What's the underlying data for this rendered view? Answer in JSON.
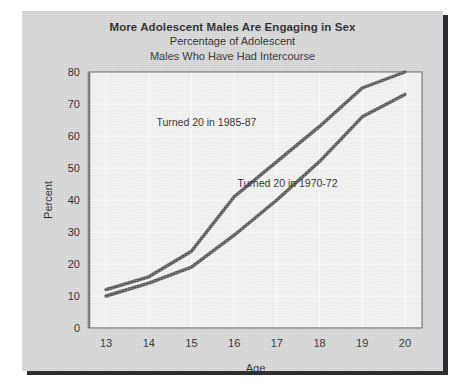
{
  "figure": {
    "title_main": "More Adolescent Males Are Engaging in Sex",
    "title_sub_line1": "Percentage of Adolescent",
    "title_sub_line2": "Males Who Have Had Intercourse",
    "card_color": "#d5d5d5",
    "plot_background": "#f2f2f2",
    "shadow_color": "#2e2e30",
    "line_color": "#585858",
    "gridline_color": "#ffffff",
    "axis_color": "#6b6b6b"
  },
  "chart_data": {
    "type": "line",
    "title": "More Adolescent Males Are Engaging in Sex",
    "subtitle": "Percentage of Adolescent Males Who Have Had Intercourse",
    "xlabel": "Age",
    "ylabel": "Percent",
    "x": [
      13,
      14,
      15,
      16,
      17,
      18,
      19,
      20
    ],
    "xticklabels": [
      "13",
      "14",
      "15",
      "16",
      "17",
      "18",
      "19",
      "20"
    ],
    "yticks": [
      0,
      10,
      20,
      30,
      40,
      50,
      60,
      70,
      80
    ],
    "yticklabels": [
      "0",
      "10",
      "20",
      "30",
      "40",
      "50",
      "60",
      "70",
      "80"
    ],
    "xlim": [
      12.6,
      20.4
    ],
    "ylim": [
      0,
      80
    ],
    "grid": true,
    "legend_position": "inline-annotations",
    "series": [
      {
        "name": "Turned 20 in 1985-87",
        "label": "Turned 20 in 1985-87",
        "color": "#585858",
        "values": [
          12,
          16,
          24,
          41,
          52,
          63,
          75,
          80
        ],
        "label_x": 15.35,
        "label_y": 63
      },
      {
        "name": "Turned 20 in 1970-72",
        "label": "Turned 20 in 1970-72",
        "color": "#585858",
        "values": [
          10,
          14,
          19,
          29,
          40,
          52,
          66,
          73
        ],
        "label_x": 17.25,
        "label_y": 44
      }
    ]
  }
}
